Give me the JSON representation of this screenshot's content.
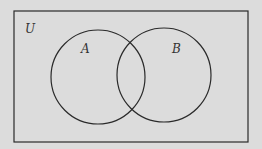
{
  "diagram": {
    "type": "venn",
    "universe_label": "U",
    "sets": [
      {
        "label": "A"
      },
      {
        "label": "B"
      }
    ],
    "colors": {
      "background": "#dcdcdc",
      "stroke": "#2a2a2a"
    }
  }
}
